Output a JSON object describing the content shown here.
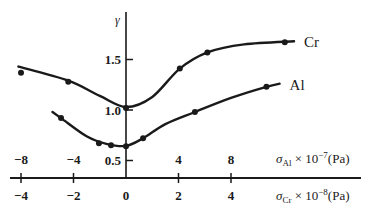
{
  "chart_data": {
    "type": "line",
    "title": "",
    "ylabel": "γ",
    "y_ticks": [
      0.5,
      1.0,
      1.5
    ],
    "y_tick_labels": [
      "0.5",
      "1.0",
      "1.5"
    ],
    "ylim": [
      0.34,
      1.98
    ],
    "x_axes": [
      {
        "name": "sigma_Al",
        "label_symbol": "σ",
        "label_sub": "Al",
        "label_mid": " × 10",
        "label_sup": "−7",
        "label_unit": "(Pa)",
        "position": "above-axis",
        "ticks": [
          -8,
          -4,
          0,
          4,
          8
        ],
        "tick_labels": [
          "−8",
          "−4",
          "",
          "4",
          "8"
        ],
        "xlim": [
          -8,
          17.5
        ]
      },
      {
        "name": "sigma_Cr",
        "label_symbol": "σ",
        "label_sub": "Cr",
        "label_mid": " × 10",
        "label_sup": "−8",
        "label_unit": "(Pa)",
        "position": "below-axis",
        "ticks": [
          -4,
          -2,
          0,
          2,
          4
        ],
        "tick_labels": [
          "−4",
          "−2",
          "0",
          "2",
          "4"
        ],
        "xlim": [
          -4,
          8.75
        ]
      }
    ],
    "series": [
      {
        "name": "Cr",
        "x_axis": "sigma_Cr",
        "points": [
          {
            "x": -4.0,
            "y": 1.37
          },
          {
            "x": -2.2,
            "y": 1.28
          },
          {
            "x": 0.0,
            "y": 1.02
          },
          {
            "x": 2.05,
            "y": 1.41
          },
          {
            "x": 3.1,
            "y": 1.57
          },
          {
            "x": 6.05,
            "y": 1.67
          }
        ],
        "curve": [
          {
            "x": -4.1,
            "y": 1.43
          },
          {
            "x": -2.2,
            "y": 1.29
          },
          {
            "x": -1.0,
            "y": 1.14
          },
          {
            "x": 0.0,
            "y": 1.03
          },
          {
            "x": 1.0,
            "y": 1.13
          },
          {
            "x": 2.05,
            "y": 1.41
          },
          {
            "x": 3.1,
            "y": 1.57
          },
          {
            "x": 4.5,
            "y": 1.65
          },
          {
            "x": 6.4,
            "y": 1.68
          }
        ]
      },
      {
        "name": "Al",
        "x_axis": "sigma_Al",
        "points": [
          {
            "x": -4.95,
            "y": 0.92
          },
          {
            "x": -2.06,
            "y": 0.67
          },
          {
            "x": -1.14,
            "y": 0.65
          },
          {
            "x": 0.0,
            "y": 0.64
          },
          {
            "x": 1.3,
            "y": 0.72
          },
          {
            "x": 5.25,
            "y": 0.98
          },
          {
            "x": 10.7,
            "y": 1.23
          }
        ],
        "curve": [
          {
            "x": -5.6,
            "y": 0.98
          },
          {
            "x": -4.95,
            "y": 0.92
          },
          {
            "x": -3.0,
            "y": 0.74
          },
          {
            "x": -1.5,
            "y": 0.665
          },
          {
            "x": 0.0,
            "y": 0.645
          },
          {
            "x": 1.3,
            "y": 0.72
          },
          {
            "x": 3.0,
            "y": 0.86
          },
          {
            "x": 5.25,
            "y": 0.98
          },
          {
            "x": 8.0,
            "y": 1.12
          },
          {
            "x": 10.7,
            "y": 1.23
          },
          {
            "x": 11.7,
            "y": 1.26
          }
        ]
      }
    ],
    "legend": "inline-labels-at-line-ends",
    "grid": false
  }
}
